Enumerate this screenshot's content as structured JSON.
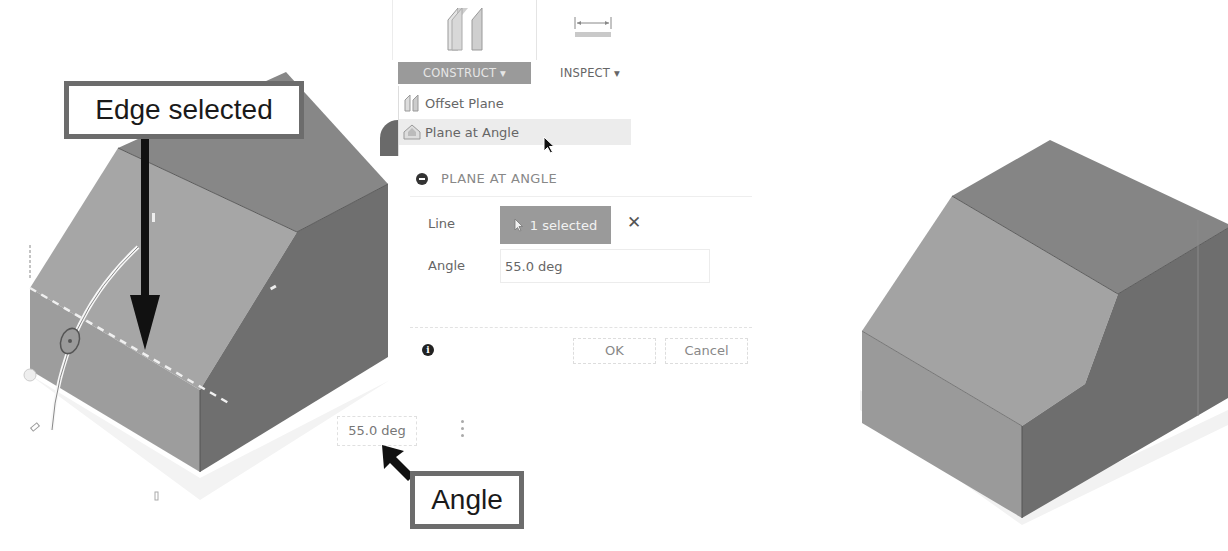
{
  "toolbar": {
    "construct_label": "CONSTRUCT ▾",
    "inspect_label": "INSPECT ▾",
    "construct_icon": "offset-planes-icon",
    "inspect_icon": "measure-icon"
  },
  "construct_menu": {
    "items": [
      {
        "label": "Offset Plane",
        "icon": "offset-plane-icon"
      },
      {
        "label": "Plane at Angle",
        "icon": "plane-at-angle-icon",
        "hovered": true
      }
    ]
  },
  "dialog": {
    "title": "PLANE AT ANGLE",
    "line_label": "Line",
    "line_value": "1 selected",
    "angle_label": "Angle",
    "angle_value": "55.0 deg",
    "ok_label": "OK",
    "cancel_label": "Cancel"
  },
  "canvas": {
    "angle_input_value": "55.0 deg"
  },
  "annotations": {
    "edge_callout": "Edge selected",
    "angle_callout": "Angle"
  },
  "colors": {
    "construct_bg": "#9a9a9a",
    "chip_bg": "#9a9a9a",
    "callout_border": "#6c6c6c",
    "face_top": "#8a8a8a",
    "face_slope": "#a4a4a4",
    "face_front": "#9c9c9c",
    "face_side": "#727272"
  }
}
